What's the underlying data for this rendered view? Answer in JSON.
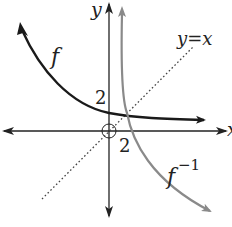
{
  "diagram": {
    "axes": {
      "x_label": "x",
      "y_label": "y",
      "origin_marker": "open-circle"
    },
    "curves": [
      {
        "name": "f",
        "label": "f",
        "color": "#1a1a1a",
        "style": "solid-thick"
      },
      {
        "name": "f_inverse",
        "label_base": "f",
        "label_sup": "−1",
        "color": "#8a8a8a",
        "style": "solid"
      },
      {
        "name": "identity",
        "label": "y=x",
        "color": "#333333",
        "style": "dotted"
      }
    ],
    "annotations": {
      "y_intercept_f": "2",
      "x_intercept_f_inverse": "2"
    },
    "colors": {
      "axis": "#222222",
      "f": "#1a1a1a",
      "f_inverse": "#8a8a8a",
      "identity": "#444444",
      "background": "#ffffff"
    }
  }
}
